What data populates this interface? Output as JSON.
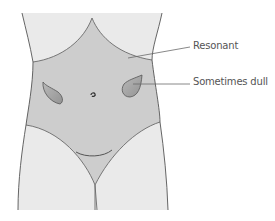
{
  "diagram": {
    "labels": [
      {
        "id": "resonant",
        "text": "Resonant"
      },
      {
        "id": "sometimes-dull",
        "text": "Sometimes dull"
      }
    ],
    "colors": {
      "background": "#ffffff",
      "skin": "#eaeaea",
      "resonant_zone": "#cdcdcd",
      "dull_organ": "#a9a9a9",
      "outline": "#555555",
      "leader_line": "#6a6a6a",
      "label_text": "#555555"
    }
  }
}
